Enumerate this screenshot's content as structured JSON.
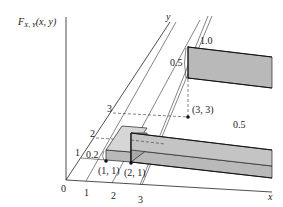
{
  "figure": {
    "vertical_axis_label": "F",
    "vertical_axis_sub": "X, Y",
    "vertical_axis_args": "(x, y)",
    "x_axis_label": "x",
    "y_axis_label": "y",
    "origin_label": "0",
    "x_ticks": [
      "1",
      "2",
      "3"
    ],
    "y_ticks": [
      "1",
      "2",
      "3"
    ],
    "points": [
      {
        "label": "(1, 1)"
      },
      {
        "label": "(2, 1)"
      },
      {
        "label": "(3, 3)"
      }
    ],
    "level_labels": {
      "first_step": "0.2",
      "lower_plateau": "0.5",
      "upper_step": "0.5",
      "upper_plateau": "1.0"
    }
  }
}
